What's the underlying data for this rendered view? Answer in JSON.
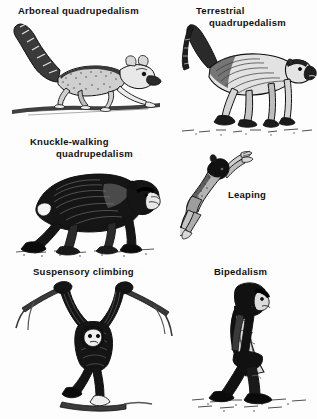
{
  "figure": {
    "background_color": "#fdfdfd",
    "ink_color": "#111111"
  },
  "panels": [
    {
      "id": "arboreal",
      "caption_line1": "Arboreal quadrupedalism",
      "caption_line2": "",
      "subject": "lemur walking along a horizontal branch",
      "illustration_name": "lemur-arboreal-quadrupedalism-illustration"
    },
    {
      "id": "terrestrial",
      "caption_line1": "Terrestrial",
      "caption_line2": "quadrupedalism",
      "subject": "baboon walking on the ground with arched tail",
      "illustration_name": "baboon-terrestrial-quadrupedalism-illustration"
    },
    {
      "id": "knuckle",
      "caption_line1": "Knuckle-walking",
      "caption_line2": "quadrupedalism",
      "subject": "chimpanzee knuckle-walking on the ground",
      "illustration_name": "chimpanzee-knuckle-walking-illustration"
    },
    {
      "id": "leaping",
      "caption_line1": "Leaping",
      "caption_line2": "",
      "subject": "galago leaping diagonally with arms outstretched",
      "illustration_name": "galago-leaping-illustration"
    },
    {
      "id": "suspensory",
      "caption_line1": "Suspensory climbing",
      "caption_line2": "",
      "subject": "gibbon hanging by both arms from branches",
      "illustration_name": "gibbon-suspensory-climbing-illustration"
    },
    {
      "id": "bipedalism",
      "caption_line1": "Bipedalism",
      "caption_line2": "",
      "subject": "hominid walking upright on two legs",
      "illustration_name": "hominid-bipedalism-illustration"
    }
  ]
}
